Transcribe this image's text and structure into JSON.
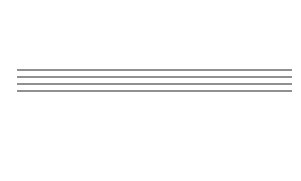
{
  "diagram": {
    "type": "3-to-8 line decoder (logic circuit)",
    "gate_symbol_and": "&",
    "gate_symbol_not": "1",
    "outputs": [
      {
        "name": "Y",
        "sub": "7"
      },
      {
        "name": "Y",
        "sub": "6"
      },
      {
        "name": "Y",
        "sub": "5"
      },
      {
        "name": "Y",
        "sub": "4"
      },
      {
        "name": "Y",
        "sub": "3"
      },
      {
        "name": "Y",
        "sub": "2"
      },
      {
        "name": "Y",
        "sub": "1"
      },
      {
        "name": "Y",
        "sub": "0"
      }
    ],
    "inputs": [
      {
        "name": "A",
        "sub": "2"
      },
      {
        "name": "A",
        "sub": "1"
      },
      {
        "name": "A",
        "sub": "0"
      }
    ],
    "bus_line_count_note": "unconfirmed - only ~4 lines resolved so far; expected 6 for a 3-input decoder",
    "line_color": "#222222",
    "background": "#ffffff"
  }
}
